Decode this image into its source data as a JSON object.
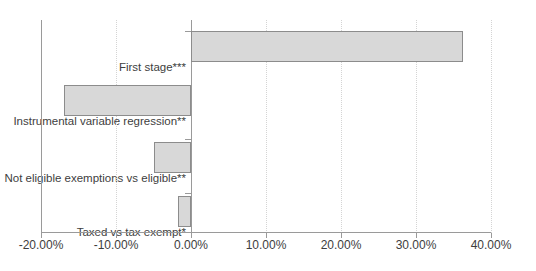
{
  "chart_data": {
    "type": "bar",
    "orientation": "horizontal",
    "title": "",
    "xlabel": "",
    "ylabel": "",
    "categories": [
      "First stage***",
      "Instrumental variable regression**",
      "Not eligible exemptions vs eligible**",
      "Taxed vs tax exempt*"
    ],
    "values": [
      36.3,
      -17.0,
      -5.0,
      -1.8
    ],
    "value_format": "percent",
    "xlim": [
      -20.0,
      40.0
    ],
    "xticks": [
      -20.0,
      -10.0,
      0.0,
      10.0,
      20.0,
      30.0,
      40.0
    ],
    "xtick_labels": [
      "-20.00%",
      "-10.00%",
      "0.00%",
      "10.00%",
      "20.00%",
      "30.00%",
      "40.00%"
    ],
    "grid": {
      "vertical": true,
      "horizontal": false,
      "style": "dotted"
    },
    "legend": {
      "show": false,
      "position": "none"
    },
    "series": [
      {
        "name": "",
        "values": [
          36.3,
          -17.0,
          -5.0,
          -1.8
        ]
      }
    ],
    "annotations": []
  },
  "style": {
    "bar_fill": "#d8d8d8",
    "bar_border": "#8c8c8c",
    "axis_color": "#9a9a9a",
    "grid_color": "#d4d4d4",
    "label_color": "#404040",
    "background": "#ffffff"
  }
}
